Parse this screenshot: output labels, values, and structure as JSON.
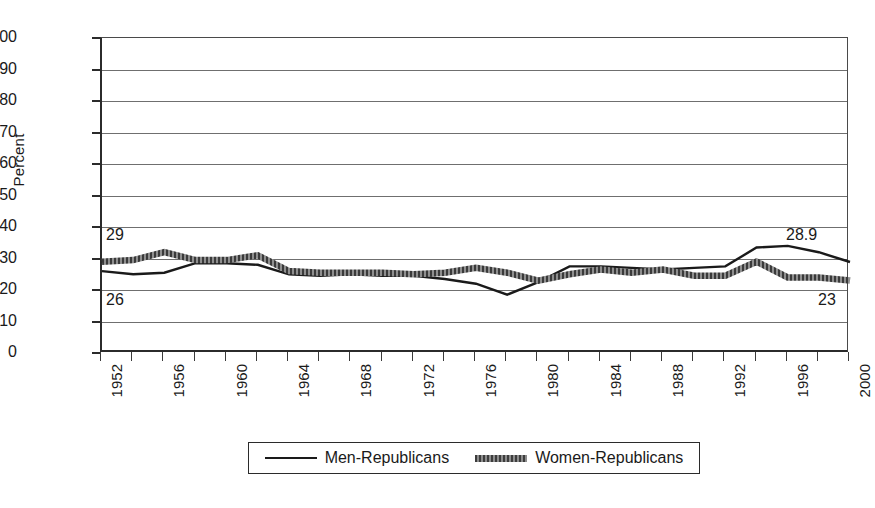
{
  "chart_data": {
    "type": "line",
    "title": "",
    "subtitle": "",
    "xlabel": "",
    "ylabel": "Percent",
    "ylim": [
      0,
      100
    ],
    "ytick_step": 10,
    "ytick_labels": [
      "100",
      "90",
      "80",
      "70",
      "60",
      "50",
      "40",
      "30",
      "20",
      "10",
      "0"
    ],
    "xlim": [
      1952,
      2000
    ],
    "grid": true,
    "grid_axis": "y",
    "legend_position": "bottom",
    "x": [
      1952,
      1954,
      1956,
      1958,
      1960,
      1962,
      1964,
      1966,
      1968,
      1970,
      1972,
      1974,
      1976,
      1978,
      1980,
      1982,
      1984,
      1986,
      1988,
      1990,
      1992,
      1994,
      1996,
      1998,
      2000
    ],
    "xtick_labels": [
      "1952",
      "1956",
      "1960",
      "1964",
      "1968",
      "1972",
      "1976",
      "1980",
      "1984",
      "1988",
      "1992",
      "1996",
      "2000"
    ],
    "xtick_years": [
      1952,
      1956,
      1960,
      1964,
      1968,
      1972,
      1976,
      1980,
      1984,
      1988,
      1992,
      1996,
      2000
    ],
    "series": [
      {
        "name": "Men-Republicans",
        "style": "thin-solid",
        "color": "#1a1a1a",
        "values": [
          26,
          25,
          25.5,
          28.5,
          28.5,
          28,
          25,
          24.5,
          25,
          24.5,
          24.5,
          23.5,
          22,
          18.5,
          22.5,
          27.5,
          27.5,
          27,
          26.5,
          27,
          27.5,
          33.5,
          34,
          32,
          28.9
        ]
      },
      {
        "name": "Women-Republicans",
        "style": "thick-textured",
        "color": "#5a5a5a",
        "values": [
          29,
          29.5,
          32,
          29.5,
          29.5,
          31,
          26,
          25.5,
          25.5,
          25.5,
          25,
          25.5,
          27,
          25.5,
          23,
          25,
          26.5,
          25.5,
          26.5,
          24.5,
          24.5,
          29,
          24,
          24,
          23
        ]
      }
    ],
    "annotations": [
      {
        "name": "men-start-value",
        "text": "26",
        "series": "Men-Republicans",
        "position": "left-below"
      },
      {
        "name": "women-start-value",
        "text": "29",
        "series": "Women-Republicans",
        "position": "left-above"
      },
      {
        "name": "men-end-value",
        "text": "28.9",
        "series": "Men-Republicans",
        "position": "right-above"
      },
      {
        "name": "women-end-value",
        "text": "23",
        "series": "Women-Republicans",
        "position": "right-below"
      }
    ]
  },
  "legend": {
    "items": [
      {
        "label": "Men-Republicans"
      },
      {
        "label": "Women-Republicans"
      }
    ]
  },
  "axis": {
    "y_title": "Percent"
  }
}
